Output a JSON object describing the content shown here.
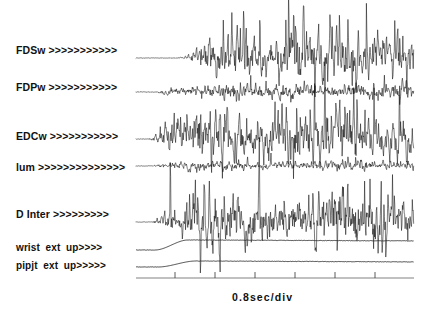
{
  "figure": {
    "type": "emg-multichannel-recording",
    "background_color": "#ffffff",
    "trace_color": "#111111",
    "axis_color": "#4a4a4a",
    "plot_area": {
      "x": 136,
      "y": 8,
      "width": 278,
      "height": 270
    },
    "time_axis": {
      "caption": "0.8sec/div",
      "tick_count": 6,
      "tick_positions_px": [
        175,
        215,
        255,
        295,
        335,
        375
      ],
      "sec_per_div": 0.8,
      "axis_y_px": 278
    },
    "channels": [
      {
        "name": "FDSw",
        "label": "FDSw >>>>>>>>>>>",
        "label_x": 16,
        "label_y": 50,
        "baseline_y": 58,
        "amplitude": 46,
        "onset_x": 176,
        "ramp_x": 196,
        "kind": "emg-burst",
        "density": 1.0,
        "seed": 11
      },
      {
        "name": "FDPw",
        "label": "FDPw >>>>>>>>>>>",
        "label_x": 16,
        "label_y": 87,
        "baseline_y": 92,
        "amplitude": 13,
        "onset_x": 155,
        "ramp_x": 160,
        "kind": "emg-low",
        "density": 0.55,
        "seed": 23
      },
      {
        "name": "EDCw",
        "label": "EDCw >>>>>>>>>>>",
        "label_x": 16,
        "label_y": 136,
        "baseline_y": 139,
        "amplitude": 44,
        "onset_x": 148,
        "ramp_x": 160,
        "kind": "emg-burst",
        "density": 1.0,
        "seed": 37
      },
      {
        "name": "lum",
        "label": "lum >>>>>>>>>>>>>>",
        "label_x": 16,
        "label_y": 167,
        "baseline_y": 166,
        "amplitude": 8,
        "onset_x": 145,
        "ramp_x": 155,
        "kind": "emg-low",
        "density": 0.6,
        "seed": 53
      },
      {
        "name": "D Inter",
        "label": "D Inter >>>>>>>>>",
        "label_x": 16,
        "label_y": 214,
        "baseline_y": 222,
        "amplitude": 44,
        "onset_x": 150,
        "ramp_x": 163,
        "kind": "emg-burst",
        "density": 1.0,
        "seed": 71
      },
      {
        "name": "wrist ext up",
        "label": "wrist  ext  up>>>>",
        "label_x": 16,
        "label_y": 248,
        "baseline_y": 250,
        "kind": "kinematic-ramp",
        "rise_start_x": 155,
        "rise_end_x": 188,
        "rise_amount": 10
      },
      {
        "name": "pipjt ext up",
        "label": "pipjt  ext  up>>>>>",
        "label_x": 16,
        "label_y": 266,
        "baseline_y": 267,
        "kind": "kinematic-ramp",
        "rise_start_x": 158,
        "rise_end_x": 196,
        "rise_amount": 6
      }
    ]
  },
  "chart_data": {
    "type": "line",
    "title": "",
    "xlabel": "0.8sec/div",
    "ylabel": "",
    "grid": false,
    "legend": "none",
    "x_axis": {
      "units": "sec",
      "per_division": 0.8,
      "divisions": 6,
      "tick_labels": [
        "",
        "",
        "",
        "",
        "",
        ""
      ]
    },
    "series": [
      {
        "name": "FDSw",
        "channel_label": "FDSw >>>>>>>>>>>",
        "kind": "emg",
        "relative_amplitude": 1.0,
        "onset_fraction": 0.145,
        "description": "high amplitude tonic burst EMG, wrist flexor digitorum superficialis"
      },
      {
        "name": "FDPw",
        "channel_label": "FDPw >>>>>>>>>>>",
        "kind": "emg",
        "relative_amplitude": 0.28,
        "onset_fraction": 0.07,
        "description": "low amplitude EMG, flexor digitorum profundus"
      },
      {
        "name": "EDCw",
        "channel_label": "EDCw >>>>>>>>>>>",
        "kind": "emg",
        "relative_amplitude": 0.95,
        "onset_fraction": 0.045,
        "description": "high amplitude EMG, extensor digitorum communis"
      },
      {
        "name": "lum",
        "channel_label": "lum >>>>>>>>>>>>>>",
        "kind": "emg",
        "relative_amplitude": 0.17,
        "onset_fraction": 0.035,
        "description": "very low amplitude EMG, lumbrical"
      },
      {
        "name": "D Inter",
        "channel_label": "D Inter >>>>>>>>>",
        "kind": "emg",
        "relative_amplitude": 0.95,
        "onset_fraction": 0.05,
        "description": "high amplitude EMG, dorsal interosseous"
      },
      {
        "name": "wrist ext up",
        "channel_label": "wrist  ext  up>>>>",
        "kind": "kinematic",
        "relative_amplitude": 0.22,
        "onset_fraction": 0.07,
        "description": "wrist extension angle, smooth upward ramp then plateau"
      },
      {
        "name": "pipjt ext up",
        "channel_label": "pipjt  ext  up>>>>>",
        "kind": "kinematic",
        "relative_amplitude": 0.13,
        "onset_fraction": 0.08,
        "description": "PIP joint extension angle, smooth upward ramp then plateau"
      }
    ]
  }
}
